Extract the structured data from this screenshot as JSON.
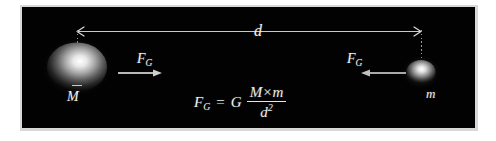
{
  "figure": {
    "background_color": "#ffffff",
    "panel_color": "#020202",
    "ink_color": "#f2f2f2"
  },
  "distance": {
    "label": "d",
    "description": "center-to-center separation arrow between the two masses"
  },
  "masses": {
    "large": {
      "label": "M",
      "name": "large-mass-sphere"
    },
    "small": {
      "label": "m",
      "name": "small-mass-sphere"
    }
  },
  "forces": {
    "left": {
      "symbol": "F",
      "subscript": "G",
      "direction": "right"
    },
    "right": {
      "symbol": "F",
      "subscript": "G",
      "direction": "left"
    }
  },
  "formula": {
    "lhs_symbol": "F",
    "lhs_subscript": "G",
    "equals": "=",
    "constant": "G",
    "numerator_left": "M",
    "numerator_operator": "×",
    "numerator_right": "m",
    "denominator_base": "d",
    "denominator_exponent": "2",
    "plain_text": "F_G = G (M × m) / d²"
  }
}
